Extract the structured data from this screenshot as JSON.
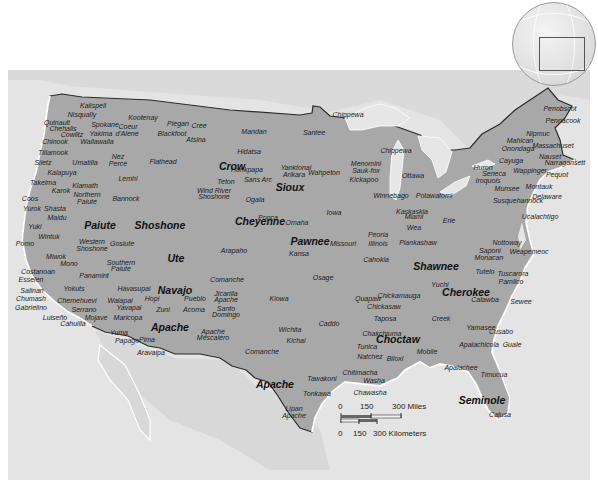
{
  "map": {
    "title": "Native American Tribes of the United States",
    "colors": {
      "background_sea": "#ebebeb",
      "land_us": "#a6a6a6",
      "land_other": "#d6d6d6",
      "lakes": "#e9e9e9",
      "border": "#2b2b2b",
      "coast_highlight": "#ffffff",
      "text": "#1c1c1c"
    },
    "major_labels": [
      {
        "name": "Crow",
        "x": 232,
        "y": 166
      },
      {
        "name": "Sioux",
        "x": 290,
        "y": 187
      },
      {
        "name": "Paiute",
        "x": 100,
        "y": 225
      },
      {
        "name": "Shoshone",
        "x": 160,
        "y": 225
      },
      {
        "name": "Cheyenne",
        "x": 260,
        "y": 221
      },
      {
        "name": "Pawnee",
        "x": 310,
        "y": 241
      },
      {
        "name": "Ute",
        "x": 176,
        "y": 258
      },
      {
        "name": "Navajo",
        "x": 175,
        "y": 290
      },
      {
        "name": "Apache",
        "x": 170,
        "y": 327
      },
      {
        "name": "Apache",
        "x": 275,
        "y": 384
      },
      {
        "name": "Shawnee",
        "x": 436,
        "y": 266
      },
      {
        "name": "Cherokee",
        "x": 466,
        "y": 292
      },
      {
        "name": "Choctaw",
        "x": 398,
        "y": 339
      },
      {
        "name": "Seminole",
        "x": 482,
        "y": 400
      }
    ],
    "tribe_labels": [
      {
        "name": "Kalispell",
        "x": 93,
        "y": 105
      },
      {
        "name": "Nisqually",
        "x": 82,
        "y": 114
      },
      {
        "name": "Kootenay",
        "x": 143,
        "y": 117
      },
      {
        "name": "Piegan",
        "x": 178,
        "y": 123
      },
      {
        "name": "Cree",
        "x": 199,
        "y": 125
      },
      {
        "name": "Quinault",
        "x": 57,
        "y": 122
      },
      {
        "name": "Chehalis",
        "x": 63,
        "y": 128
      },
      {
        "name": "Spokane",
        "x": 105,
        "y": 124
      },
      {
        "name": "Coeur",
        "x": 128,
        "y": 126
      },
      {
        "name": "d'Alene",
        "x": 127,
        "y": 133
      },
      {
        "name": "Blackfoot",
        "x": 172,
        "y": 133
      },
      {
        "name": "Cowlitz",
        "x": 72,
        "y": 134
      },
      {
        "name": "Yakima",
        "x": 101,
        "y": 133
      },
      {
        "name": "Atsina",
        "x": 196,
        "y": 139
      },
      {
        "name": "Mandan",
        "x": 254,
        "y": 131
      },
      {
        "name": "Santee",
        "x": 314,
        "y": 132
      },
      {
        "name": "Chippewa",
        "x": 348,
        "y": 114
      },
      {
        "name": "Chinook",
        "x": 55,
        "y": 141
      },
      {
        "name": "Wallawalla",
        "x": 97,
        "y": 141
      },
      {
        "name": "Chippewa",
        "x": 396,
        "y": 150
      },
      {
        "name": "Tillamook",
        "x": 53,
        "y": 152
      },
      {
        "name": "Hidatsa",
        "x": 249,
        "y": 151
      },
      {
        "name": "Siletz",
        "x": 43,
        "y": 162
      },
      {
        "name": "Umatilla",
        "x": 85,
        "y": 162
      },
      {
        "name": "Nez",
        "x": 118,
        "y": 156
      },
      {
        "name": "Perce",
        "x": 118,
        "y": 163
      },
      {
        "name": "Flathead",
        "x": 163,
        "y": 161
      },
      {
        "name": "Menomini",
        "x": 366,
        "y": 163
      },
      {
        "name": "Sauk-fox",
        "x": 366,
        "y": 170
      },
      {
        "name": "Kickapoo",
        "x": 364,
        "y": 179
      },
      {
        "name": "Ottawa",
        "x": 413,
        "y": 175
      },
      {
        "name": "Kalapuya",
        "x": 62,
        "y": 172
      },
      {
        "name": "Hunkpapa",
        "x": 247,
        "y": 169
      },
      {
        "name": "Yanktonai",
        "x": 296,
        "y": 167
      },
      {
        "name": "Arikara",
        "x": 294,
        "y": 174
      },
      {
        "name": "Wahpeton",
        "x": 324,
        "y": 172
      },
      {
        "name": "Sans Arc",
        "x": 258,
        "y": 179
      },
      {
        "name": "Teton",
        "x": 226,
        "y": 181
      },
      {
        "name": "Lemhi",
        "x": 128,
        "y": 178
      },
      {
        "name": "Takelma",
        "x": 43,
        "y": 182
      },
      {
        "name": "Klamath",
        "x": 85,
        "y": 185
      },
      {
        "name": "Karok",
        "x": 61,
        "y": 190
      },
      {
        "name": "Northern",
        "x": 87,
        "y": 194
      },
      {
        "name": "Paiute",
        "x": 87,
        "y": 201
      },
      {
        "name": "Bannock",
        "x": 126,
        "y": 198
      },
      {
        "name": "Wind River",
        "x": 214,
        "y": 190
      },
      {
        "name": "Shoshone",
        "x": 214,
        "y": 196
      },
      {
        "name": "Winnebago",
        "x": 391,
        "y": 195
      },
      {
        "name": "Potawatomi",
        "x": 434,
        "y": 195
      },
      {
        "name": "Coos",
        "x": 30,
        "y": 198
      },
      {
        "name": "Yurok",
        "x": 32,
        "y": 208
      },
      {
        "name": "Shasta",
        "x": 55,
        "y": 208
      },
      {
        "name": "Ogala",
        "x": 255,
        "y": 199
      },
      {
        "name": "Iowa",
        "x": 334,
        "y": 212
      },
      {
        "name": "Kaskaskia",
        "x": 412,
        "y": 211
      },
      {
        "name": "Miami",
        "x": 414,
        "y": 216
      },
      {
        "name": "Erie",
        "x": 449,
        "y": 220
      },
      {
        "name": "Munsee",
        "x": 507,
        "y": 188
      },
      {
        "name": "Susquehannock",
        "x": 518,
        "y": 200
      },
      {
        "name": "Maidu",
        "x": 57,
        "y": 217
      },
      {
        "name": "Ponca",
        "x": 268,
        "y": 217
      },
      {
        "name": "Omaha",
        "x": 297,
        "y": 222
      },
      {
        "name": "Wea",
        "x": 414,
        "y": 227
      },
      {
        "name": "Peoria",
        "x": 378,
        "y": 234
      },
      {
        "name": "Yuki",
        "x": 35,
        "y": 226
      },
      {
        "name": "Wintuk",
        "x": 49,
        "y": 236
      },
      {
        "name": "Pomo",
        "x": 25,
        "y": 243
      },
      {
        "name": "Western",
        "x": 92,
        "y": 241
      },
      {
        "name": "Shoshone",
        "x": 92,
        "y": 248
      },
      {
        "name": "Gosiute",
        "x": 122,
        "y": 243
      },
      {
        "name": "Missouri",
        "x": 343,
        "y": 243
      },
      {
        "name": "Illinois",
        "x": 378,
        "y": 243
      },
      {
        "name": "Piankashaw",
        "x": 418,
        "y": 242
      },
      {
        "name": "Arapaho",
        "x": 234,
        "y": 250
      },
      {
        "name": "Kansa",
        "x": 299,
        "y": 253
      },
      {
        "name": "Miwok",
        "x": 56,
        "y": 256
      },
      {
        "name": "Mono",
        "x": 69,
        "y": 263
      },
      {
        "name": "Southern",
        "x": 121,
        "y": 262
      },
      {
        "name": "Paiute",
        "x": 121,
        "y": 268
      },
      {
        "name": "Cahokia",
        "x": 376,
        "y": 259
      },
      {
        "name": "Costanoan",
        "x": 38,
        "y": 271
      },
      {
        "name": "Esselen",
        "x": 31,
        "y": 279
      },
      {
        "name": "Panamint",
        "x": 94,
        "y": 275
      },
      {
        "name": "Comanche",
        "x": 227,
        "y": 279
      },
      {
        "name": "Osage",
        "x": 323,
        "y": 277
      },
      {
        "name": "Nottoway",
        "x": 507,
        "y": 242
      },
      {
        "name": "Saponi",
        "x": 490,
        "y": 250
      },
      {
        "name": "Monacan",
        "x": 489,
        "y": 257
      },
      {
        "name": "Weapemeoc",
        "x": 529,
        "y": 251
      },
      {
        "name": "Tutelo",
        "x": 485,
        "y": 271
      },
      {
        "name": "Tuscarora",
        "x": 513,
        "y": 273
      },
      {
        "name": "Pamlico",
        "x": 511,
        "y": 281
      },
      {
        "name": "Yuchi",
        "x": 440,
        "y": 284
      },
      {
        "name": "Catawba",
        "x": 485,
        "y": 299
      },
      {
        "name": "Sewee",
        "x": 521,
        "y": 301
      },
      {
        "name": "Salinan",
        "x": 32,
        "y": 290
      },
      {
        "name": "Yokuts",
        "x": 74,
        "y": 288
      },
      {
        "name": "Havasupai",
        "x": 134,
        "y": 288
      },
      {
        "name": "Pueblo",
        "x": 195,
        "y": 298
      },
      {
        "name": "Jicarilla",
        "x": 226,
        "y": 293
      },
      {
        "name": "Apache",
        "x": 226,
        "y": 299
      },
      {
        "name": "Kiowa",
        "x": 279,
        "y": 298
      },
      {
        "name": "Quapaw",
        "x": 368,
        "y": 298
      },
      {
        "name": "Chickamauga",
        "x": 399,
        "y": 295
      },
      {
        "name": "Chumash",
        "x": 31,
        "y": 298
      },
      {
        "name": "Chemehuevi",
        "x": 77,
        "y": 300
      },
      {
        "name": "Walapai",
        "x": 120,
        "y": 300
      },
      {
        "name": "Hopi",
        "x": 152,
        "y": 298
      },
      {
        "name": "Chickasaw",
        "x": 384,
        "y": 306
      },
      {
        "name": "Gabrielino",
        "x": 31,
        "y": 307
      },
      {
        "name": "Serrano",
        "x": 84,
        "y": 309
      },
      {
        "name": "Yavapai",
        "x": 129,
        "y": 307
      },
      {
        "name": "Zuni",
        "x": 163,
        "y": 309
      },
      {
        "name": "Acoma",
        "x": 194,
        "y": 309
      },
      {
        "name": "Santo",
        "x": 226,
        "y": 308
      },
      {
        "name": "Domingo",
        "x": 226,
        "y": 314
      },
      {
        "name": "Luiseño",
        "x": 55,
        "y": 317
      },
      {
        "name": "Mojave",
        "x": 96,
        "y": 317
      },
      {
        "name": "Maricopa",
        "x": 128,
        "y": 317
      },
      {
        "name": "Taposa",
        "x": 385,
        "y": 318
      },
      {
        "name": "Creek",
        "x": 441,
        "y": 318
      },
      {
        "name": "Yamasee",
        "x": 481,
        "y": 327
      },
      {
        "name": "Cahuilla",
        "x": 73,
        "y": 323
      },
      {
        "name": "Caddo",
        "x": 329,
        "y": 323
      },
      {
        "name": "Wichita",
        "x": 290,
        "y": 329
      },
      {
        "name": "Chakchiuma",
        "x": 382,
        "y": 333
      },
      {
        "name": "Cusabo",
        "x": 501,
        "y": 331
      },
      {
        "name": "Yuma",
        "x": 119,
        "y": 332
      },
      {
        "name": "Apache",
        "x": 213,
        "y": 331
      },
      {
        "name": "Mescalero",
        "x": 213,
        "y": 337
      },
      {
        "name": "Kichai",
        "x": 296,
        "y": 340
      },
      {
        "name": "Tunica",
        "x": 367,
        "y": 346
      },
      {
        "name": "Mobile",
        "x": 427,
        "y": 351
      },
      {
        "name": "Apalachicola",
        "x": 479,
        "y": 344
      },
      {
        "name": "Guale",
        "x": 512,
        "y": 344
      },
      {
        "name": "Papago",
        "x": 127,
        "y": 340
      },
      {
        "name": "Pima",
        "x": 147,
        "y": 339
      },
      {
        "name": "Natchez",
        "x": 370,
        "y": 356
      },
      {
        "name": "Biloxi",
        "x": 395,
        "y": 358
      },
      {
        "name": "Aravaipa",
        "x": 151,
        "y": 352
      },
      {
        "name": "Comanche",
        "x": 262,
        "y": 351
      },
      {
        "name": "Apalachee",
        "x": 461,
        "y": 367
      },
      {
        "name": "Timucua",
        "x": 494,
        "y": 374
      },
      {
        "name": "Tawakoni",
        "x": 322,
        "y": 378
      },
      {
        "name": "Chitimacha",
        "x": 360,
        "y": 372
      },
      {
        "name": "Washa",
        "x": 374,
        "y": 380
      },
      {
        "name": "Tonkawa",
        "x": 317,
        "y": 393
      },
      {
        "name": "Chawasha",
        "x": 370,
        "y": 392
      },
      {
        "name": "Lipan",
        "x": 294,
        "y": 408
      },
      {
        "name": "Apache",
        "x": 294,
        "y": 415
      },
      {
        "name": "Calusa",
        "x": 500,
        "y": 414
      },
      {
        "name": "Penobscot",
        "x": 560,
        "y": 108
      },
      {
        "name": "Pennacook",
        "x": 563,
        "y": 120
      },
      {
        "name": "Nipmuc",
        "x": 538,
        "y": 133
      },
      {
        "name": "Mahican",
        "x": 520,
        "y": 140
      },
      {
        "name": "Massachuset",
        "x": 553,
        "y": 145
      },
      {
        "name": "Onondaga",
        "x": 518,
        "y": 148
      },
      {
        "name": "Nauset",
        "x": 550,
        "y": 156
      },
      {
        "name": "Cayuga",
        "x": 511,
        "y": 160
      },
      {
        "name": "Narragansett",
        "x": 565,
        "y": 162
      },
      {
        "name": "Huron",
        "x": 483,
        "y": 167
      },
      {
        "name": "Wappinger",
        "x": 530,
        "y": 170
      },
      {
        "name": "Seneca",
        "x": 494,
        "y": 173
      },
      {
        "name": "Pequot",
        "x": 557,
        "y": 174
      },
      {
        "name": "Iroquois",
        "x": 488,
        "y": 180
      },
      {
        "name": "Montauk",
        "x": 539,
        "y": 186
      },
      {
        "name": "Delaware",
        "x": 547,
        "y": 196
      },
      {
        "name": "Lenni Lenape",
        "x": 0,
        "y": 0,
        "hidden": true
      },
      {
        "name": "Nanticoke",
        "x": 0,
        "y": 0,
        "hidden": true
      },
      {
        "name": "Ucalachtigo",
        "x": 540,
        "y": 216
      }
    ],
    "scale_bar": {
      "miles_ticks": [
        "0",
        "150",
        "300 Miles"
      ],
      "km_ticks": [
        "0",
        "150",
        "300 Kilometers"
      ]
    },
    "inset_globe": {
      "label": "locator-globe"
    }
  }
}
